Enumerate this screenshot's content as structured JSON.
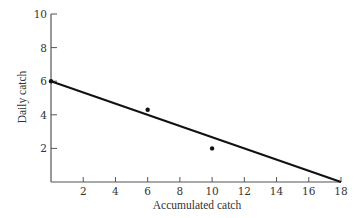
{
  "chart_data": {
    "type": "scatter",
    "title": "",
    "xlabel": "Accumulated catch",
    "ylabel": "Daily catch",
    "xlim": [
      0,
      18
    ],
    "ylim": [
      0,
      10
    ],
    "grid": false,
    "legend": null,
    "x_ticks": [
      2,
      4,
      6,
      8,
      10,
      12,
      14,
      16,
      18
    ],
    "y_ticks": [
      2,
      4,
      6,
      8,
      10
    ],
    "points": [
      {
        "x": 0,
        "y": 6
      },
      {
        "x": 6,
        "y": 4.3
      },
      {
        "x": 10,
        "y": 2
      }
    ],
    "fit_line": {
      "x0": 0,
      "y0": 6,
      "x1": 18,
      "y1": 0
    },
    "annotations": []
  },
  "colors": {
    "axis": "#555555",
    "line": "#111111",
    "points": "#111111",
    "text": "#333333"
  }
}
